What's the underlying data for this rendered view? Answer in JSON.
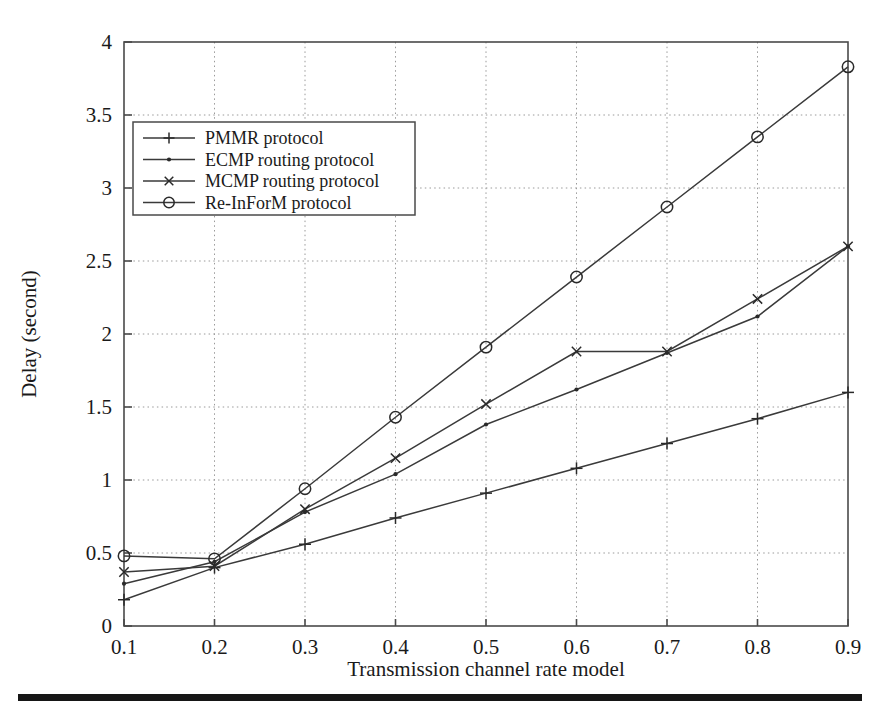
{
  "figure": {
    "background_color": "#ffffff",
    "line_color": "#3a3a3a",
    "grid_color": "#9a9a9a",
    "frame_color": "#4a4a4a"
  },
  "chart_data": {
    "type": "line",
    "title": "",
    "xlabel": "Transmission channel rate model",
    "ylabel": "Delay (second)",
    "x": [
      0.1,
      0.2,
      0.3,
      0.4,
      0.5,
      0.6,
      0.7,
      0.8,
      0.9
    ],
    "xticklabels": [
      "0.1",
      "0.2",
      "0.3",
      "0.4",
      "0.5",
      "0.6",
      "0.7",
      "0.8",
      "0.9"
    ],
    "yticklabels": [
      "0",
      "0.5",
      "1",
      "1.5",
      "2",
      "2.5",
      "3",
      "3.5",
      "4"
    ],
    "yticks": [
      0,
      0.5,
      1,
      1.5,
      2,
      2.5,
      3,
      3.5,
      4
    ],
    "xlim": [
      0.1,
      0.9
    ],
    "ylim": [
      0,
      4
    ],
    "grid": true,
    "legend_position": "upper-left",
    "series": [
      {
        "name": "PMMR protocol",
        "marker": "plus",
        "values": [
          0.18,
          0.4,
          0.56,
          0.74,
          0.91,
          1.08,
          1.25,
          1.42,
          1.6
        ]
      },
      {
        "name": "ECMP routing protocol",
        "marker": "dot",
        "values": [
          0.29,
          0.44,
          0.78,
          1.04,
          1.38,
          1.62,
          1.87,
          2.12,
          2.6
        ]
      },
      {
        "name": "MCMP routing protocol",
        "marker": "x-cross",
        "values": [
          0.37,
          0.41,
          0.8,
          1.15,
          1.52,
          1.88,
          1.88,
          2.24,
          2.6
        ]
      },
      {
        "name": "Re-InForM protocol",
        "marker": "circle",
        "values": [
          0.48,
          0.46,
          0.94,
          1.43,
          1.91,
          2.39,
          2.87,
          3.35,
          3.83
        ]
      }
    ]
  }
}
